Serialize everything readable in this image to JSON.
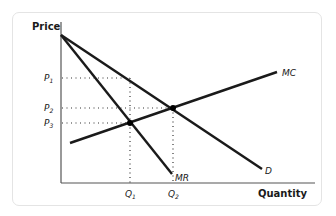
{
  "diagram": {
    "type": "economics-monopoly-price-quantity",
    "axes": {
      "y_label": "Price",
      "x_label": "Quantity"
    },
    "curves": [
      {
        "id": "D",
        "label": "D",
        "description": "Demand curve"
      },
      {
        "id": "MR",
        "label": "MR",
        "description": "Marginal revenue curve"
      },
      {
        "id": "MC",
        "label": "MC",
        "description": "Marginal cost curve"
      }
    ],
    "price_ticks": [
      {
        "base": "P",
        "sub": "1"
      },
      {
        "base": "P",
        "sub": "2"
      },
      {
        "base": "P",
        "sub": "3"
      }
    ],
    "quantity_ticks": [
      {
        "base": "Q",
        "sub": "1"
      },
      {
        "base": "Q",
        "sub": "2"
      }
    ],
    "points": [
      {
        "name": "MR-MC intersection",
        "at": [
          "Q1",
          "P3"
        ]
      },
      {
        "name": "D-MC intersection",
        "at": [
          "Q2",
          "P2"
        ]
      }
    ],
    "colors": {
      "line": "#1a1a1a",
      "axis": "#555555",
      "card_border": "#e4e4e4"
    }
  }
}
